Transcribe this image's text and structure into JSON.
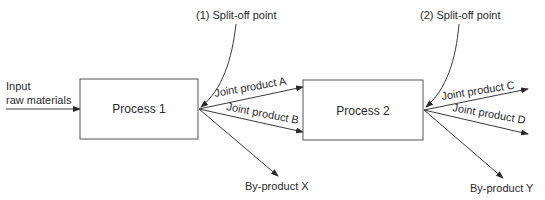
{
  "diagram": {
    "input_label_line1": "Input",
    "input_label_line2": "raw materials",
    "process1": "Process 1",
    "process2": "Process 2",
    "split1": "(1) Split-off point",
    "split2": "(2) Split-off point",
    "joint_a": "Joint product A",
    "joint_b": "Joint product B",
    "joint_c": "Joint product C",
    "joint_d": "Joint product D",
    "byproduct_x": "By-product X",
    "byproduct_y": "By-product Y"
  },
  "colors": {
    "line": "#3a3a3a",
    "text": "#2a2a2a"
  }
}
